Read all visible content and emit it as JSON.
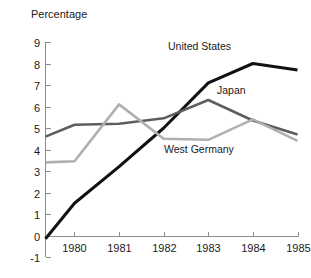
{
  "chart_data": {
    "type": "line",
    "title": "",
    "ylabel": "Percentage",
    "xlabel": "",
    "x": [
      1979.35,
      1980,
      1981,
      1982,
      1983,
      1984,
      1985
    ],
    "xtick_labels": [
      "1980",
      "1981",
      "1982",
      "1983",
      "1984",
      "1985"
    ],
    "xticks": [
      1980,
      1981,
      1982,
      1983,
      1984,
      1985
    ],
    "ytick_labels": [
      "9",
      "8",
      "7",
      "6",
      "5",
      "4",
      "3",
      "2",
      "1",
      "0",
      "-1"
    ],
    "yticks": [
      9,
      8,
      7,
      6,
      5,
      4,
      3,
      2,
      1,
      0,
      -1
    ],
    "ylim": [
      -1,
      9
    ],
    "xlim": [
      1979.35,
      1985
    ],
    "grid": false,
    "legend_position": "inline-annotations",
    "series": [
      {
        "name": "United States",
        "color": "#111111",
        "width": 3.0,
        "values": [
          -0.15,
          1.5,
          3.2,
          5.0,
          7.1,
          8.0,
          7.7
        ]
      },
      {
        "name": "Japan",
        "color": "#5e5e5e",
        "width": 2.6,
        "values": [
          4.6,
          5.15,
          5.2,
          5.45,
          6.3,
          5.35,
          4.7
        ]
      },
      {
        "name": "West Germany",
        "color": "#b0b0b0",
        "width": 2.6,
        "values": [
          3.4,
          3.45,
          6.1,
          4.5,
          4.45,
          5.4,
          4.4
        ]
      }
    ],
    "annotations": [
      {
        "text": "United States",
        "x_px": 168,
        "y_px": 50,
        "color": "#1a1a1a"
      },
      {
        "text": "Japan",
        "x_px": 217,
        "y_px": 94,
        "color": "#1a1a1a"
      },
      {
        "text": "West Germany",
        "x_px": 164,
        "y_px": 153,
        "color": "#1a1a1a"
      }
    ]
  },
  "axis": {
    "y_title": "Percentage"
  }
}
